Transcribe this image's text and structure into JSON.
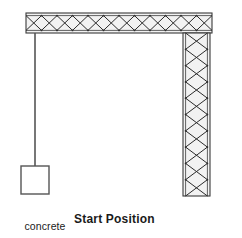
{
  "figure": {
    "title": "Start Position",
    "block_label_line1": "concrete",
    "block_label_line2": "block",
    "colors": {
      "stroke": "#3a3a3a",
      "lattice_stroke": "#2b2b2b",
      "fill": "#f2f2f2",
      "text": "#1a1a1a",
      "background": "#ffffff"
    }
  },
  "geometry": {
    "horizontal_beam": {
      "x": 26,
      "y": 13,
      "width": 186,
      "height": 20,
      "lattice_cells": 12,
      "label": "horizontal lattice beam"
    },
    "vertical_column": {
      "x": 183,
      "y": 33,
      "width": 27,
      "height": 163,
      "lattice_cells": 10,
      "label": "vertical lattice column"
    },
    "cable": {
      "x": 35,
      "y_top": 33,
      "y_bottom": 166,
      "label": "hanging cable"
    },
    "concrete_block": {
      "x": 21,
      "y": 166,
      "width": 28,
      "height": 28,
      "label": "concrete block"
    }
  }
}
